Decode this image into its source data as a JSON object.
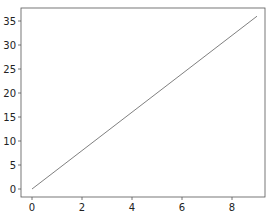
{
  "chart_data": {
    "type": "line",
    "title": "",
    "xlabel": "",
    "ylabel": "",
    "x": [
      0,
      1,
      2,
      3,
      4,
      5,
      6,
      7,
      8,
      9
    ],
    "series": [
      {
        "name": "y = 4x",
        "values": [
          0,
          4,
          8,
          12,
          16,
          20,
          24,
          28,
          32,
          36
        ],
        "color": "#808080"
      }
    ],
    "xlim": [
      -0.45,
      9.3
    ],
    "ylim": [
      -1.8,
      37.8
    ],
    "xticks": [
      "0",
      "2",
      "4",
      "6",
      "8"
    ],
    "yticks": [
      "0",
      "5",
      "10",
      "15",
      "20",
      "25",
      "30",
      "35"
    ],
    "grid": false,
    "legend": null
  }
}
